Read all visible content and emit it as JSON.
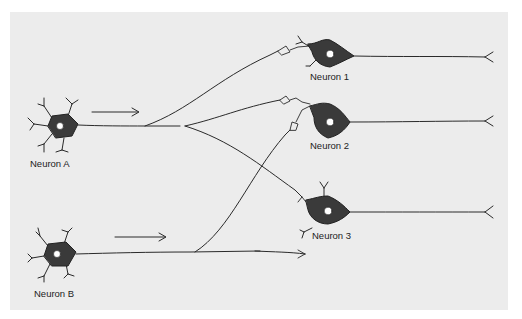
{
  "diagram": {
    "type": "neural-circuit",
    "background_color": "#ececec",
    "soma_color": "#3a3a3a",
    "line_color": "#2a2a2a",
    "neurons": [
      {
        "id": "A",
        "label": "Neuron A",
        "role": "presynaptic"
      },
      {
        "id": "B",
        "label": "Neuron B",
        "role": "presynaptic"
      },
      {
        "id": "1",
        "label": "Neuron 1",
        "role": "postsynaptic"
      },
      {
        "id": "2",
        "label": "Neuron 2",
        "role": "postsynaptic"
      },
      {
        "id": "3",
        "label": "Neuron 3",
        "role": "postsynaptic"
      }
    ],
    "arrows": [
      {
        "from": "Neuron A",
        "direction": "right"
      },
      {
        "from": "Neuron B",
        "direction": "right"
      }
    ],
    "connections": [
      {
        "from": "Neuron A",
        "to": "Neuron 1"
      },
      {
        "from": "Neuron A",
        "to": "Neuron 2"
      },
      {
        "from": "Neuron A",
        "to": "Neuron 3"
      },
      {
        "from": "Neuron B",
        "to": "Neuron 2"
      },
      {
        "from": "Neuron B",
        "to": "Neuron 3"
      }
    ]
  }
}
